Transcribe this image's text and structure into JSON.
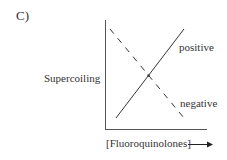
{
  "figure": {
    "panel_label": "C)",
    "y_axis_label": "Supercoiling",
    "x_axis_label": "[Fluoroquinolones]",
    "x_axis_arrow": "right-arrow"
  },
  "series": [
    {
      "name": "positive",
      "style": "solid",
      "trend": "increasing",
      "color": "#333333"
    },
    {
      "name": "negative",
      "style": "dashed",
      "trend": "decreasing",
      "color": "#333333"
    }
  ],
  "labels": {
    "positive": "positive",
    "negative": "negative"
  }
}
